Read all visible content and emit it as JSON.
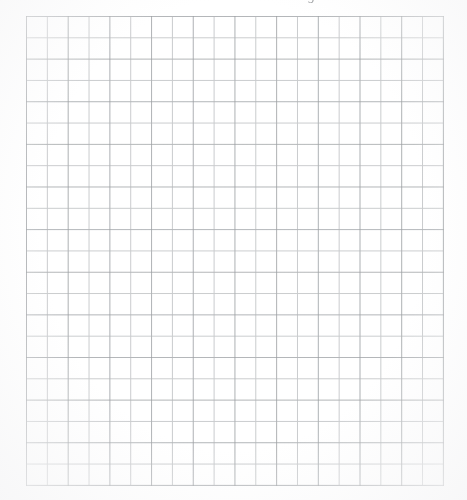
{
  "document": {
    "kind": "graph-paper-scan",
    "background_color": "#ffffff",
    "page_width": 467,
    "page_height": 500
  },
  "header": {
    "clipped_text": "ng. 542",
    "note_visible": "only the lower fragments of the glyphs are within the image; the line is cut off by the top edge",
    "text_color": "#6d7074"
  },
  "grid": {
    "left": 26,
    "top": 16,
    "width": 417,
    "height": 469,
    "columns": 20,
    "rows": 22,
    "cell_width": 20.85,
    "cell_height": 21.32,
    "line_color": "#c9cbcd",
    "major_line_color": "#969a9e",
    "line_width": 1,
    "contents": "",
    "contents_note": "grid interior is empty — no writing, drawing or marks"
  }
}
